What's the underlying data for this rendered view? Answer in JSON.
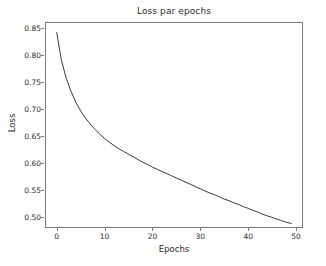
{
  "chart_data": {
    "type": "line",
    "title": "Loss par epochs",
    "xlabel": "Epochs",
    "ylabel": "Loss",
    "xlim": [
      -2.45,
      51.45
    ],
    "ylim": [
      0.4805,
      0.8615
    ],
    "grid": false,
    "legend": null,
    "line_color": "#3a3a3a",
    "line_width": 1,
    "xticks": [
      0,
      10,
      20,
      30,
      40,
      50
    ],
    "xtick_labels": [
      "0",
      "10",
      "20",
      "30",
      "40",
      "50"
    ],
    "yticks": [
      0.5,
      0.55,
      0.6,
      0.65,
      0.7,
      0.75,
      0.8,
      0.85
    ],
    "ytick_labels": [
      "0.50",
      "0.55",
      "0.60",
      "0.65",
      "0.70",
      "0.75",
      "0.80",
      "0.85"
    ],
    "x": [
      0,
      1,
      2,
      3,
      4,
      5,
      6,
      7,
      8,
      9,
      10,
      11,
      12,
      13,
      14,
      15,
      16,
      17,
      18,
      19,
      20,
      21,
      22,
      23,
      24,
      25,
      26,
      27,
      28,
      29,
      30,
      31,
      32,
      33,
      34,
      35,
      36,
      37,
      38,
      39,
      40,
      41,
      42,
      43,
      44,
      45,
      46,
      47,
      48,
      49
    ],
    "y": [
      0.842,
      0.79,
      0.757,
      0.733,
      0.713,
      0.697,
      0.684,
      0.673,
      0.663,
      0.654,
      0.646,
      0.639,
      0.633,
      0.627,
      0.622,
      0.617,
      0.612,
      0.607,
      0.602,
      0.598,
      0.593,
      0.589,
      0.585,
      0.581,
      0.577,
      0.573,
      0.569,
      0.565,
      0.561,
      0.557,
      0.553,
      0.549,
      0.545,
      0.542,
      0.538,
      0.534,
      0.531,
      0.527,
      0.524,
      0.52,
      0.517,
      0.513,
      0.51,
      0.506,
      0.503,
      0.5,
      0.497,
      0.494,
      0.491,
      0.489
    ],
    "series_name": "Loss"
  }
}
